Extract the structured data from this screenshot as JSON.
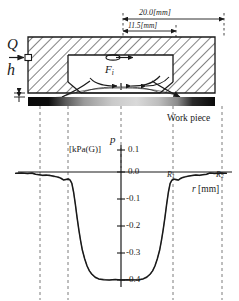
{
  "figure": {
    "type": "technical-diagram-with-chart",
    "schematic": {
      "dimension_top": {
        "label": "20.0[mm]",
        "value": 20.0,
        "unit": "mm"
      },
      "dimension_mid": {
        "label": "11.5[mm]",
        "value": 11.5,
        "unit": "mm"
      },
      "inlet_label": "Q",
      "gap_label": "h",
      "force_label": "F",
      "force_subscript": "i",
      "workpiece_label": "Work piece",
      "hatch_color": "#1a1a1a",
      "body_fill": "#ffffff"
    },
    "chart_data": {
      "type": "line",
      "title": "",
      "subtitle": "",
      "ylabel_symbol": "p",
      "ylabel_unit": "[kPa(G)]",
      "xlabel": "r [mm]",
      "xlabel_symbol": "r",
      "xlabel_unit": "[mm]",
      "ytick_labels": [
        "0.1",
        "0.0",
        "-0.1",
        "-0.2",
        "-0.3",
        "-0.4"
      ],
      "ytick_values": [
        0.1,
        0.0,
        -0.1,
        -0.2,
        -0.3,
        -0.4
      ],
      "ylim": [
        -0.4,
        0.1
      ],
      "grid": false,
      "legend": "none",
      "annotations": [
        {
          "text": "R",
          "sub": "1",
          "x": 10.5,
          "y": 0.0
        },
        {
          "text": "R",
          "sub": "2",
          "x": 16.5,
          "y": 0.0
        }
      ],
      "series": [
        {
          "name": "pressure distribution",
          "x": [
            -18.0,
            -17.0,
            -16.0,
            -15.2,
            -14.6,
            -14.0,
            -13.4,
            -12.8,
            -12.2,
            -11.6,
            -11.0,
            -10.6,
            -10.2,
            -9.8,
            -9.4,
            -9.0,
            -8.7,
            -8.4,
            -8.1,
            -7.8,
            -7.5,
            -7.2,
            -6.9,
            -6.6,
            -6.2,
            -5.8,
            -5.4,
            -5.0,
            -4.4,
            -3.8,
            -3.0,
            -2.0,
            -1.0,
            0.0,
            1.0,
            2.0,
            3.0,
            3.8,
            4.4,
            5.0,
            5.4,
            5.8,
            6.2,
            6.6,
            6.9,
            7.2,
            7.5,
            7.8,
            8.1,
            8.4,
            8.7,
            9.0,
            9.4,
            9.8,
            10.2,
            10.6,
            11.0,
            11.6,
            12.2,
            12.8,
            13.4,
            14.0,
            14.6,
            15.2,
            16.0,
            17.0,
            18.0
          ],
          "y": [
            -0.005,
            -0.004,
            -0.006,
            -0.004,
            -0.008,
            -0.01,
            -0.012,
            -0.011,
            -0.013,
            -0.015,
            -0.018,
            -0.02,
            -0.024,
            -0.03,
            -0.028,
            -0.026,
            -0.03,
            -0.042,
            -0.075,
            -0.12,
            -0.17,
            -0.215,
            -0.255,
            -0.29,
            -0.322,
            -0.348,
            -0.366,
            -0.378,
            -0.39,
            -0.396,
            -0.399,
            -0.4,
            -0.398,
            -0.4,
            -0.399,
            -0.4,
            -0.399,
            -0.396,
            -0.39,
            -0.378,
            -0.366,
            -0.348,
            -0.322,
            -0.29,
            -0.255,
            -0.215,
            -0.17,
            -0.12,
            -0.075,
            -0.042,
            -0.03,
            -0.026,
            -0.028,
            -0.03,
            -0.024,
            -0.02,
            -0.018,
            -0.015,
            -0.013,
            -0.011,
            -0.012,
            -0.01,
            -0.008,
            -0.004,
            -0.006,
            -0.004,
            -0.005
          ]
        }
      ]
    }
  }
}
